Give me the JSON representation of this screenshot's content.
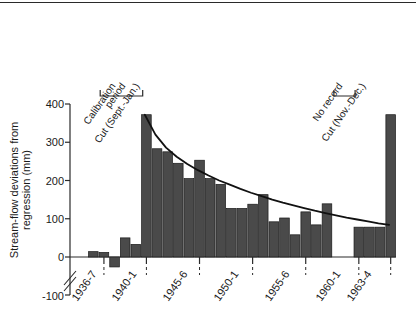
{
  "figure": {
    "top_rule": true
  },
  "chart_data": {
    "type": "bar",
    "title": "",
    "xlabel": "",
    "ylabel": "Stream-flow deviations from regression (mm)",
    "ylabel_line1": "Stream-flow deviations from",
    "ylabel_line2": "regression (mm)",
    "ylim": [
      -100,
      400
    ],
    "ytick_labels": [
      "-100",
      "0",
      "100",
      "200",
      "300",
      "400"
    ],
    "ytick_values": [
      -100,
      0,
      100,
      200,
      300,
      400
    ],
    "grid": false,
    "legend": null,
    "axis_break": true,
    "xtick_labels": [
      "1936-7",
      "1940-1",
      "1945-6",
      "1950-1",
      "1955-6",
      "1960-1",
      "1963-4"
    ],
    "xtick_index": [
      1,
      5,
      10,
      15,
      20,
      25,
      28
    ],
    "categories": [
      "1935-6",
      "1936-7",
      "1937-8",
      "1938-9",
      "1939-40",
      "1940-1",
      "1941-2",
      "1942-3",
      "1943-4",
      "1944-5",
      "1945-6",
      "1946-7",
      "1947-8",
      "1948-9",
      "1949-50",
      "1950-1",
      "1951-2",
      "1952-3",
      "1953-4",
      "1954-5",
      "1955-6",
      "1956-7",
      "1957-8",
      "1958-9",
      "1959-60",
      "1960-1",
      "1961-2",
      "1962-3",
      "1963-4"
    ],
    "values": [
      14,
      12,
      -26,
      50,
      33,
      372,
      283,
      275,
      245,
      205,
      253,
      205,
      190,
      127,
      127,
      138,
      163,
      92,
      102,
      58,
      118,
      84,
      139,
      null,
      null,
      78,
      78,
      78,
      372
    ],
    "missing_label": "No record",
    "bar_color": "#4a4a4a",
    "curve": {
      "label": "fitted exponential decay",
      "points": [
        [
          5,
          372
        ],
        [
          6,
          320
        ],
        [
          7,
          286
        ],
        [
          8,
          262
        ],
        [
          9,
          243
        ],
        [
          10,
          227
        ],
        [
          11,
          213
        ],
        [
          12,
          200
        ],
        [
          13,
          189
        ],
        [
          14,
          178
        ],
        [
          15,
          168
        ],
        [
          16,
          159
        ],
        [
          17,
          150
        ],
        [
          18,
          142
        ],
        [
          19,
          135
        ],
        [
          20,
          128
        ],
        [
          21,
          121
        ],
        [
          22,
          115
        ],
        [
          23,
          109
        ],
        [
          24,
          103
        ],
        [
          25,
          98
        ],
        [
          26,
          93
        ],
        [
          27,
          88
        ],
        [
          28,
          84
        ]
      ],
      "color": "#111111"
    },
    "annotations": [
      {
        "id": "calibration-period",
        "text": "Calibration period",
        "text_line1": "Calibration",
        "text_line2": "period",
        "bracket_from_index": 1,
        "bracket_to_index": 5
      },
      {
        "id": "cut-sept-jan",
        "text": "Cut (Sept.-Jan.)",
        "tick_index": 5
      },
      {
        "id": "no-record",
        "text": "No record",
        "bracket_from_index": 23,
        "bracket_to_index": 25
      },
      {
        "id": "cut-nov-dec",
        "text": "Cut (Nov.-Dec.)",
        "tick_index": 28
      }
    ]
  }
}
